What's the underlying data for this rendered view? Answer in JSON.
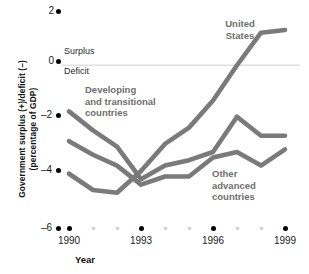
{
  "chart_data": {
    "type": "line",
    "title": "",
    "xlabel": "Year",
    "ylabel": "Government surplus (+)/deficit (–)\n(percentage of GDP)",
    "x": [
      1990,
      1991,
      1992,
      1993,
      1994,
      1995,
      1996,
      1997,
      1998,
      1999
    ],
    "xlim": [
      1989.4,
      1999.4
    ],
    "ylim": [
      -6,
      2
    ],
    "yticks": [
      2,
      0,
      -2,
      -4,
      -6
    ],
    "ytick_labels": [
      "2",
      "0",
      "–2",
      "–4",
      "–6"
    ],
    "xticks": [
      1990,
      1993,
      1996,
      1999
    ],
    "xtick_labels": [
      "1990",
      "1993",
      "1996",
      "1999"
    ],
    "xticks_minor": [
      1991,
      1992,
      1994,
      1995,
      1997,
      1998
    ],
    "grid": false,
    "zero_line": true,
    "zero_line_color": "#e0e0e0",
    "series_color": "#7a7a7a",
    "legend_position": "inline-annotations",
    "series": [
      {
        "name": "United States",
        "values": [
          -4.0,
          -4.6,
          -4.7,
          -3.9,
          -2.9,
          -2.3,
          -1.3,
          0.0,
          1.2,
          1.3
        ]
      },
      {
        "name": "Developing and transitional countries",
        "values": [
          -1.7,
          -2.4,
          -3.0,
          -4.2,
          -3.7,
          -3.5,
          -3.2,
          -1.9,
          -2.6,
          -2.6
        ]
      },
      {
        "name": "Other advanced countries",
        "values": [
          -2.8,
          -3.3,
          -3.7,
          -4.4,
          -4.1,
          -4.1,
          -3.4,
          -3.2,
          -3.7,
          -3.1
        ]
      }
    ],
    "annotations": [
      {
        "text": "Surplus",
        "value_region": "above-zero-line"
      },
      {
        "text": "Deficit",
        "value_region": "below-zero-line"
      }
    ]
  },
  "axis": {
    "y_title_line1": "Government surplus (+)/deficit (–)",
    "y_title_line2": "(percentage of GDP)",
    "x_title": "Year"
  },
  "labels": {
    "surplus": "Surplus",
    "deficit": "Deficit",
    "united_states": "United\nStates",
    "developing": "Developing\nand transitional\ncountries",
    "other_advanced": "Other\nadvanced\ncountries"
  },
  "yticks": {
    "t0": "2",
    "t1": "0",
    "t2": "–2",
    "t3": "–4",
    "t4": "–6"
  },
  "xticks": {
    "t0": "1990",
    "t1": "1993",
    "t2": "1996",
    "t3": "1999"
  }
}
